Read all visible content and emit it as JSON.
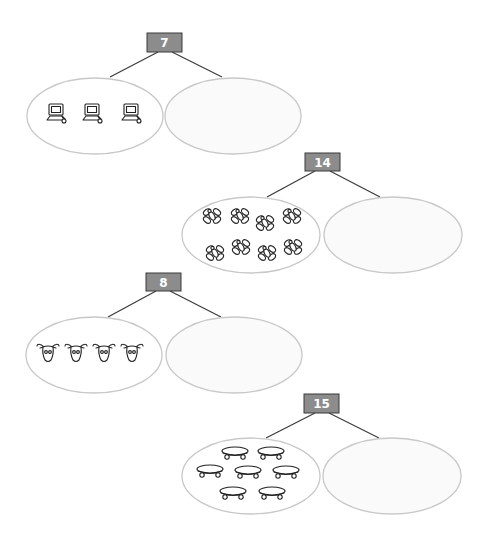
{
  "worksheet": {
    "type": "number-bonds",
    "colors": {
      "number_box": "#8c8c8c",
      "number_text": "#ffffff",
      "ellipse_stroke": "#c8c8c8",
      "connector": "#3a3a3a"
    },
    "bonds": [
      {
        "whole": "7",
        "known_part_count": 3,
        "known_part_item": "computer-icon",
        "unknown_part": ""
      },
      {
        "whole": "14",
        "known_part_count": 8,
        "known_part_item": "fly-icon",
        "unknown_part": ""
      },
      {
        "whole": "8",
        "known_part_count": 4,
        "known_part_item": "goat-head-icon",
        "unknown_part": ""
      },
      {
        "whole": "15",
        "known_part_count": 7,
        "known_part_item": "skateboard-icon",
        "unknown_part": ""
      }
    ]
  }
}
